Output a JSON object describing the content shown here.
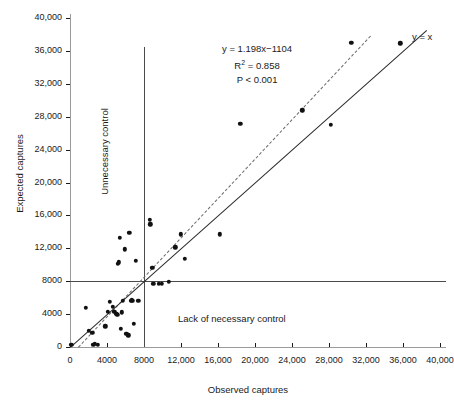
{
  "chart_data": {
    "type": "scatter",
    "title": "",
    "xlabel": "Observed captures",
    "ylabel": "Expected captures",
    "xlim": [
      0,
      40000
    ],
    "ylim": [
      0,
      40000
    ],
    "xticks": [
      "0",
      "4000",
      "8000",
      "12,000",
      "16,000",
      "20,000",
      "24,000",
      "28,000",
      "32,000",
      "36,000",
      "40,000"
    ],
    "yticks": [
      "0",
      "4000",
      "8000",
      "12,000",
      "16,000",
      "20,000",
      "24,000",
      "28,000",
      "32,000",
      "36,000",
      "40,000"
    ],
    "grid": false,
    "legend": "none",
    "annotations": {
      "equation": "y = 1.198x−1104",
      "r_squared_prefix": "R",
      "r_squared_sup": "2",
      "r_squared_value": " = 0.858",
      "pvalue": "P < 0.001",
      "identity_line": "y = x",
      "quadrant_lower_right": "Lack of necessary control",
      "quadrant_upper_left": "Unnecessary control"
    },
    "reference_lines": {
      "vertical_x": 8000,
      "vertical_top": 36500,
      "horizontal_y": 8000
    },
    "series": [
      {
        "name": "regression",
        "type": "line",
        "style": "dashed",
        "color": "#6a6a6a",
        "slope": 1.198,
        "intercept": -1104,
        "x_start": 900,
        "x_end": 32500
      },
      {
        "name": "y = x",
        "type": "line",
        "style": "solid",
        "color": "#2a2a2a",
        "slope": 1.0,
        "intercept": 0,
        "x_start": 0,
        "x_end": 38500
      },
      {
        "name": "sites",
        "type": "scatter",
        "color": "#111111",
        "points": [
          [
            150,
            300
          ],
          [
            1700,
            4800
          ],
          [
            2000,
            2000
          ],
          [
            2400,
            1700
          ],
          [
            2500,
            300
          ],
          [
            2700,
            400
          ],
          [
            3000,
            300
          ],
          [
            3800,
            2500
          ],
          [
            4100,
            4300
          ],
          [
            4300,
            5500
          ],
          [
            4600,
            4900
          ],
          [
            4800,
            4300
          ],
          [
            5000,
            4000
          ],
          [
            5100,
            3900
          ],
          [
            5200,
            10100
          ],
          [
            5300,
            10300
          ],
          [
            5400,
            13300
          ],
          [
            5500,
            2200
          ],
          [
            5600,
            4200
          ],
          [
            5700,
            5600
          ],
          [
            5900,
            11900
          ],
          [
            6100,
            1600
          ],
          [
            6300,
            1400
          ],
          [
            6400,
            13900
          ],
          [
            6600,
            5600
          ],
          [
            6700,
            5700
          ],
          [
            6800,
            5600
          ],
          [
            6900,
            2800
          ],
          [
            7100,
            10500
          ],
          [
            7400,
            5600
          ],
          [
            8600,
            15500
          ],
          [
            8700,
            14900
          ],
          [
            8900,
            9600
          ],
          [
            9000,
            7700
          ],
          [
            9600,
            7700
          ],
          [
            9900,
            7700
          ],
          [
            10700,
            7900
          ],
          [
            11400,
            12100
          ],
          [
            12000,
            13700
          ],
          [
            12400,
            10700
          ],
          [
            16200,
            13700
          ],
          [
            18400,
            27100
          ],
          [
            25100,
            28800
          ],
          [
            28200,
            27000
          ],
          [
            30400,
            37000
          ],
          [
            35700,
            36900
          ]
        ]
      }
    ]
  }
}
